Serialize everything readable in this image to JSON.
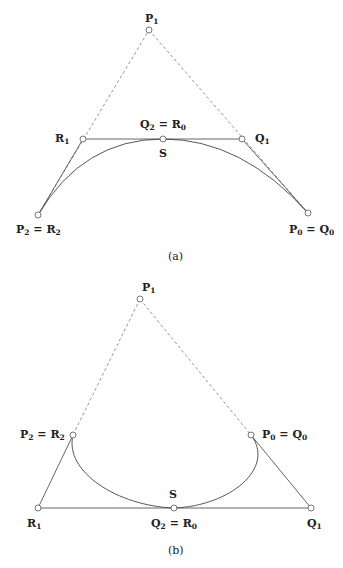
{
  "figure_a": {
    "caption": "(a)",
    "points": {
      "P1": {
        "x": 149,
        "y": 30
      },
      "R1": {
        "x": 83,
        "y": 139
      },
      "Q2R0": {
        "x": 163,
        "y": 139
      },
      "Q1": {
        "x": 242,
        "y": 139
      },
      "P2R2": {
        "x": 38,
        "y": 215
      },
      "P0Q0": {
        "x": 308,
        "y": 213
      }
    },
    "labels": {
      "P1": {
        "main": "P",
        "sub": "1"
      },
      "R1": {
        "main": "R",
        "sub": "1"
      },
      "Q2_eq_R0": {
        "left": "Q",
        "left_sub": "2",
        "eq": " = ",
        "right": "R",
        "right_sub": "0"
      },
      "Q1": {
        "main": "Q",
        "sub": "1"
      },
      "S": "S",
      "P2_eq_R2": {
        "left": "P",
        "left_sub": "2",
        "eq": " = ",
        "right": "R",
        "right_sub": "2"
      },
      "P0_eq_Q0": {
        "left": "P",
        "left_sub": "0",
        "eq": " = ",
        "right": "Q",
        "right_sub": "0"
      }
    }
  },
  "figure_b": {
    "caption": "(b)",
    "points": {
      "P1": {
        "x": 140,
        "y": 299
      },
      "P2R2": {
        "x": 73,
        "y": 435
      },
      "P0Q0": {
        "x": 251,
        "y": 435
      },
      "R1": {
        "x": 38,
        "y": 508
      },
      "Q2R0": {
        "x": 174,
        "y": 508
      },
      "Q1": {
        "x": 311,
        "y": 508
      }
    },
    "labels": {
      "P1": {
        "main": "P",
        "sub": "1"
      },
      "P2_eq_R2": {
        "left": "P",
        "left_sub": "2",
        "eq": " = ",
        "right": "R",
        "right_sub": "2"
      },
      "P0_eq_Q0": {
        "left": "P",
        "left_sub": "0",
        "eq": " = ",
        "right": "Q",
        "right_sub": "0"
      },
      "S": "S",
      "R1": {
        "main": "R",
        "sub": "1"
      },
      "Q2_eq_R0": {
        "left": "Q",
        "left_sub": "2",
        "eq": " = ",
        "right": "R",
        "right_sub": "0"
      },
      "Q1": {
        "main": "Q",
        "sub": "1"
      }
    }
  },
  "colors": {
    "dashed_line": "#8a8a8a",
    "solid_line": "#555555",
    "curve": "#444444",
    "text": "#222222"
  }
}
